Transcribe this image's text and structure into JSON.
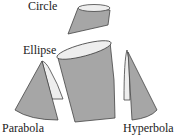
{
  "diagram": {
    "labels": {
      "circle": "Circle",
      "ellipse": "Ellipse",
      "parabola": "Parabola",
      "hyperbola": "Hyperbola"
    },
    "colors": {
      "cone_fill": "#a6a6a6",
      "section_fill": "#eeeeee",
      "stroke": "#444444"
    }
  }
}
